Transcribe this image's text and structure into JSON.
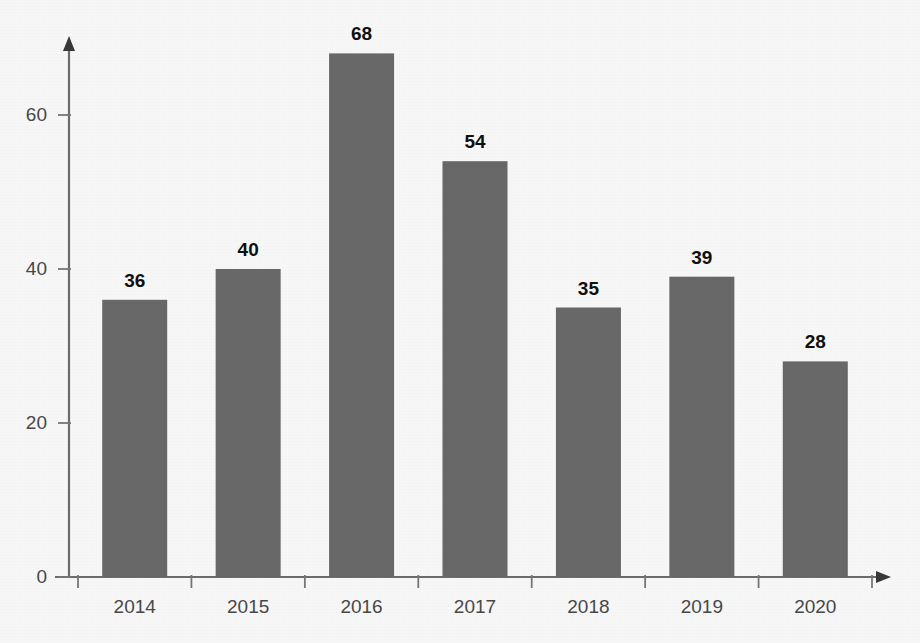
{
  "chart_data": {
    "type": "bar",
    "title": "",
    "subtitle": "",
    "xlabel": "",
    "ylabel": "",
    "categories": [
      "2014",
      "2015",
      "2016",
      "2017",
      "2018",
      "2019",
      "2020"
    ],
    "values": [
      36,
      40,
      68,
      54,
      35,
      39,
      28
    ],
    "value_labels": [
      "36",
      "40",
      "68",
      "54",
      "35",
      "39",
      "28"
    ],
    "ylim": [
      0,
      75
    ],
    "yticks": [
      0,
      20,
      40,
      60
    ],
    "ytick_labels": [
      "0",
      "20",
      "40",
      "60"
    ],
    "grid": false,
    "legend": null,
    "legend_position": "none",
    "annotations": [],
    "axis_style": {
      "y_axis_arrow": true,
      "x_axis_arrow": true,
      "x_ticks_at_boundaries": true
    },
    "colors": {
      "bar_fill": "#6b6b6b",
      "axis": "#6f6f6f",
      "tick_label": "#4a4a4a",
      "value_label": "#111111",
      "background": "#fefefe"
    }
  }
}
